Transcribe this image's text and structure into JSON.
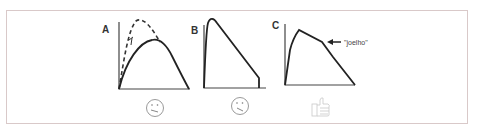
{
  "figure": {
    "panels": [
      {
        "label": "A",
        "curves": [
          "dashed-curve",
          "solid-curve"
        ],
        "icon": "sad-face-icon"
      },
      {
        "label": "B",
        "curves": [
          "solid-curve"
        ],
        "icon": "sad-face-icon"
      },
      {
        "label": "C",
        "curves": [
          "solid-curve-with-knee"
        ],
        "annotation": "\"joelho\"",
        "icon": "thumbs-up-icon"
      }
    ],
    "colors": {
      "line": "#222222",
      "border": "#d9c9c9",
      "icon": "#999999",
      "icon_faint": "#c8c8c8"
    }
  }
}
